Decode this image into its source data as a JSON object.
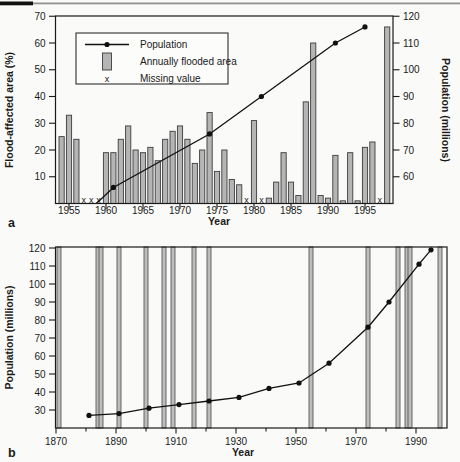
{
  "figure": {
    "panel_a_label": "a",
    "panel_b_label": "b",
    "missing_marker_glyph": "x",
    "background": "#fafaf8",
    "bar_fill": "#b5b5b5",
    "line_color": "#111111"
  },
  "chart_data": [
    {
      "id": "a",
      "type": "bar",
      "title": "",
      "xlabel": "Year",
      "ylabel_left": "Flood-affected area (%)",
      "ylabel_right": "Population (millions)",
      "ylim_left": [
        0,
        70
      ],
      "yticks_left": [
        10,
        20,
        30,
        40,
        50,
        60,
        70
      ],
      "ylim_right": [
        50,
        120
      ],
      "yticks_right": [
        60,
        70,
        80,
        90,
        100,
        110,
        120
      ],
      "x_ticks": [
        1955,
        1960,
        1965,
        1970,
        1975,
        1980,
        1985,
        1990,
        1995
      ],
      "grid": false,
      "legend_position": "upper-left-inside",
      "legend": [
        {
          "icon": "line-dot",
          "label": "Population"
        },
        {
          "icon": "bar",
          "label": "Annually flooded area"
        },
        {
          "icon": "x",
          "label": "Missing value"
        }
      ],
      "bars": {
        "years": [
          1954,
          1955,
          1956,
          1957,
          1958,
          1959,
          1960,
          1961,
          1962,
          1963,
          1964,
          1965,
          1966,
          1967,
          1968,
          1969,
          1970,
          1971,
          1972,
          1973,
          1974,
          1975,
          1976,
          1977,
          1978,
          1979,
          1980,
          1981,
          1982,
          1983,
          1984,
          1985,
          1986,
          1987,
          1988,
          1989,
          1990,
          1991,
          1992,
          1993,
          1994,
          1995,
          1996,
          1997,
          1998
        ],
        "values": [
          25,
          33,
          24,
          null,
          null,
          null,
          19,
          19,
          24,
          29,
          20,
          19,
          21,
          16,
          24,
          27,
          29,
          24,
          15,
          20,
          34,
          12,
          20,
          9,
          7,
          null,
          31,
          null,
          2,
          8,
          19,
          8,
          3,
          38,
          60,
          3,
          2,
          18,
          1,
          19,
          1,
          21,
          23,
          null,
          66
        ]
      },
      "missing_years": [
        1957,
        1958,
        1959,
        1979,
        1981,
        1997
      ],
      "population_line": {
        "start": {
          "year": 1958.7,
          "population": 50
        },
        "years": [
          1961,
          1974,
          1981,
          1991,
          1995
        ],
        "values": [
          56,
          76,
          90,
          110,
          116
        ]
      }
    },
    {
      "id": "b",
      "type": "line",
      "title": "",
      "xlabel": "Year",
      "ylabel": "Population (millions)",
      "xlim": [
        1869.7,
        2000
      ],
      "x_major_ticks": [
        1870,
        1890,
        1910,
        1930,
        1950,
        1970,
        1990
      ],
      "x_minor_ticks": [
        1880,
        1900,
        1920,
        1940,
        1960,
        1980
      ],
      "ylim": [
        20,
        120
      ],
      "yticks": [
        30,
        40,
        50,
        60,
        70,
        80,
        90,
        100,
        110,
        120
      ],
      "grid": false,
      "flood_event_years": [
        1871,
        1884,
        1885,
        1891,
        1900,
        1906,
        1909,
        1916,
        1921,
        1955,
        1974,
        1984,
        1987,
        1988,
        1998
      ],
      "population": {
        "years": [
          1881,
          1891,
          1901,
          1911,
          1921,
          1931,
          1941,
          1951,
          1961,
          1974,
          1981,
          1991,
          1995
        ],
        "values": [
          27,
          28,
          31,
          33,
          35,
          37,
          42,
          45,
          56,
          76,
          90,
          111,
          119
        ]
      }
    }
  ]
}
